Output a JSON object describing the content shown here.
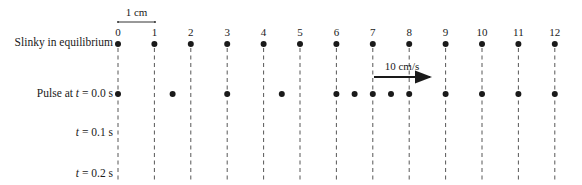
{
  "scale_bar": {
    "label": "1 cm"
  },
  "rows": [
    {
      "label": "Slinky in equilibrium"
    },
    {
      "label_prefix": "Pulse at ",
      "label_var": "t",
      "label_suffix": " = 0.0 s"
    },
    {
      "label_var": "t",
      "label_suffix": " = 0.1 s"
    },
    {
      "label_var": "t",
      "label_suffix": " = 0.2 s"
    }
  ],
  "positions": [
    "0",
    "1",
    "2",
    "3",
    "4",
    "5",
    "6",
    "7",
    "8",
    "9",
    "10",
    "11",
    "12"
  ],
  "equilibrium_dots_cm": [
    0,
    1,
    2,
    3,
    4,
    5,
    6,
    7,
    8,
    9,
    10,
    11,
    12
  ],
  "pulse_t0_dots_cm": [
    0,
    1.5,
    3,
    4.5,
    6,
    6.5,
    7,
    7.5,
    8,
    9,
    10,
    11,
    12
  ],
  "velocity_arrow": {
    "label": "10 cm/s",
    "direction": "right"
  },
  "colors": {
    "ink": "#1a1a1a",
    "dash": "#444444"
  }
}
